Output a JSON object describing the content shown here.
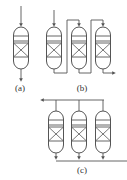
{
  "diagram": {
    "labels": {
      "a": "(a)",
      "b": "(b)",
      "c": "(c)"
    },
    "line_color": "#555555",
    "configurations": [
      {
        "id": "a",
        "type": "single reactor",
        "vessels": 1
      },
      {
        "id": "b",
        "type": "reactors in series",
        "vessels": 3
      },
      {
        "id": "c",
        "type": "reactors in parallel",
        "vessels": 3
      }
    ]
  }
}
